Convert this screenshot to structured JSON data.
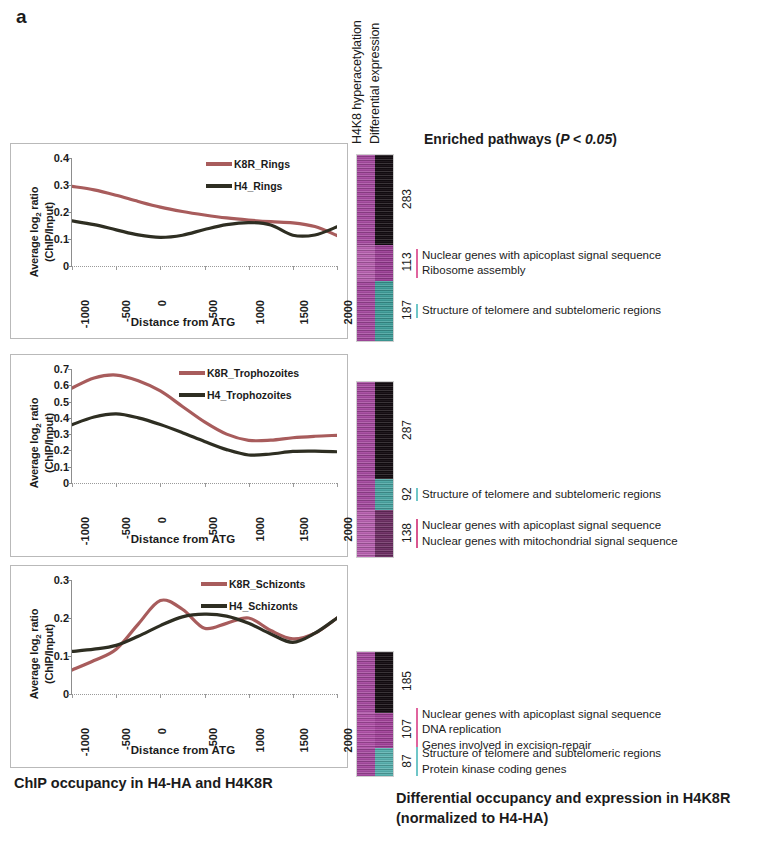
{
  "figure": {
    "panel_label": "a",
    "caption_left": "ChIP occupancy in H4-HA and H4K8R",
    "caption_right_line1": "Differential occupancy and expression in H4K8R",
    "caption_right_line2": "(normalized to H4-HA)",
    "enriched_title_prefix": "Enriched pathways (",
    "enriched_title_italic": "P < 0.05",
    "enriched_title_suffix": ")"
  },
  "heatmap_headers": [
    {
      "label": "H4K8 hyperacetylation"
    },
    {
      "label": "Differential expression"
    }
  ],
  "colors": {
    "k8r_line": "#a85c5c",
    "h4_line": "#2e2e22",
    "heat_magenta": "#b455ab",
    "heat_magenta_dark": "#9c3f96",
    "heat_black": "#1a1016",
    "heat_teal": "#3f9e9a",
    "bar_pink": "#e0649e",
    "bar_teal": "#6fc6c8",
    "axis": "#8d8d8d",
    "panel_border": "#b9b9b9"
  },
  "charts": [
    {
      "id": "rings",
      "y_ticks": [
        "0.4",
        "0.3",
        "0.2",
        "0.1",
        "0"
      ],
      "legend": [
        {
          "label": "K8R_Rings",
          "color": "#a85c5c"
        },
        {
          "label": "H4_Rings",
          "color": "#2e2e22"
        }
      ]
    },
    {
      "id": "trophozoites",
      "y_ticks": [
        "0.7",
        "0.6",
        "0.5",
        "0.4",
        "0.3",
        "0.2",
        "0.1",
        "0"
      ],
      "legend": [
        {
          "label": "K8R_Trophozoites",
          "color": "#a85c5c"
        },
        {
          "label": "H4_Trophozoites",
          "color": "#2e2e22"
        }
      ]
    },
    {
      "id": "schizonts",
      "y_ticks": [
        "0.3",
        "0.2",
        "0.1",
        "0"
      ],
      "legend": [
        {
          "label": "K8R_Schizonts",
          "color": "#a85c5c"
        },
        {
          "label": "H4_Schizonts",
          "color": "#2e2e22"
        }
      ]
    }
  ],
  "axis_titles": {
    "y_line1": "Average log",
    "y_sub": "2",
    "y_line1b": " ratio",
    "y_line2": "(ChIP/Input)",
    "x": "Distance from ATG"
  },
  "x_ticklabels": [
    "-1000",
    "-500",
    "0",
    "500",
    "1000",
    "1500",
    "2000"
  ],
  "chart_data": [
    {
      "type": "line",
      "id": "rings",
      "title": "",
      "xlabel": "Distance from ATG",
      "ylabel": "Average log2 ratio (ChIP/Input)",
      "xlim": [
        -1000,
        2000
      ],
      "ylim": [
        0,
        0.4
      ],
      "yticks": [
        0,
        0.1,
        0.2,
        0.3,
        0.4
      ],
      "xticks": [
        -1000,
        -500,
        0,
        500,
        1000,
        1500,
        2000
      ],
      "grid": false,
      "legend_position": "top-right",
      "x": [
        -1000,
        -750,
        -500,
        -250,
        0,
        250,
        500,
        750,
        1000,
        1250,
        1500,
        1750,
        2000
      ],
      "series": [
        {
          "name": "K8R_Rings",
          "color": "#a85c5c",
          "values": [
            0.295,
            0.282,
            0.262,
            0.239,
            0.218,
            0.202,
            0.189,
            0.178,
            0.17,
            0.164,
            0.16,
            0.146,
            0.113
          ]
        },
        {
          "name": "H4_Rings",
          "color": "#2e2e22",
          "values": [
            0.167,
            0.153,
            0.134,
            0.115,
            0.106,
            0.114,
            0.135,
            0.153,
            0.161,
            0.152,
            0.114,
            0.115,
            0.145
          ]
        }
      ]
    },
    {
      "type": "line",
      "id": "trophozoites",
      "title": "",
      "xlabel": "Distance from ATG",
      "ylabel": "Average log2 ratio (ChIP/Input)",
      "xlim": [
        -1000,
        2000
      ],
      "ylim": [
        0,
        0.7
      ],
      "yticks": [
        0,
        0.1,
        0.2,
        0.3,
        0.4,
        0.5,
        0.6,
        0.7
      ],
      "xticks": [
        -1000,
        -500,
        0,
        500,
        1000,
        1500,
        2000
      ],
      "grid": false,
      "legend_position": "top-right",
      "x": [
        -1000,
        -750,
        -500,
        -250,
        0,
        250,
        500,
        750,
        1000,
        1250,
        1500,
        1750,
        2000
      ],
      "series": [
        {
          "name": "K8R_Trophozoites",
          "color": "#a85c5c",
          "values": [
            0.583,
            0.645,
            0.663,
            0.628,
            0.565,
            0.47,
            0.375,
            0.3,
            0.262,
            0.263,
            0.278,
            0.287,
            0.293
          ]
        },
        {
          "name": "H4_Trophozoites",
          "color": "#2e2e22",
          "values": [
            0.358,
            0.405,
            0.424,
            0.4,
            0.359,
            0.309,
            0.255,
            0.205,
            0.172,
            0.178,
            0.194,
            0.196,
            0.192
          ]
        }
      ]
    },
    {
      "type": "line",
      "id": "schizonts",
      "title": "",
      "xlabel": "Distance from ATG",
      "ylabel": "Average log2 ratio (ChIP/Input)",
      "xlim": [
        -1000,
        2000
      ],
      "ylim": [
        0,
        0.3
      ],
      "yticks": [
        0,
        0.1,
        0.2,
        0.3
      ],
      "xticks": [
        -1000,
        -500,
        0,
        500,
        1000,
        1500,
        2000
      ],
      "grid": false,
      "legend_position": "top-right",
      "x": [
        -1000,
        -750,
        -500,
        -250,
        0,
        250,
        500,
        750,
        1000,
        1250,
        1500,
        1750,
        2000
      ],
      "series": [
        {
          "name": "K8R_Schizonts",
          "color": "#a85c5c",
          "values": [
            0.063,
            0.088,
            0.118,
            0.184,
            0.246,
            0.223,
            0.173,
            0.186,
            0.2,
            0.167,
            0.145,
            0.16,
            0.2
          ]
        },
        {
          "name": "H4_Schizonts",
          "color": "#2e2e22",
          "values": [
            0.112,
            0.118,
            0.128,
            0.152,
            0.18,
            0.203,
            0.21,
            0.205,
            0.186,
            0.158,
            0.136,
            0.16,
            0.2
          ]
        }
      ]
    }
  ],
  "heatmaps": [
    {
      "id": "rings",
      "groups": [
        {
          "count": "283",
          "bar_color": "none",
          "hyperacet": "#a64aa0",
          "diffexpr": "#140d12",
          "pathways": []
        },
        {
          "count": "113",
          "bar_color": "#e0649e",
          "hyperacet": "#b861b0",
          "diffexpr": "#9c3f96",
          "pathways": [
            "Nuclear genes with apicoplast signal sequence",
            "Ribosome assembly"
          ]
        },
        {
          "count": "187",
          "bar_color": "#6fc6c8",
          "hyperacet": "#a64aa0",
          "diffexpr": "#3f9e9a",
          "pathways": [
            "Structure of telomere and subtelomeric regions"
          ]
        }
      ]
    },
    {
      "id": "trophozoites",
      "groups": [
        {
          "count": "287",
          "bar_color": "none",
          "hyperacet": "#a64aa0",
          "diffexpr": "#140d12",
          "pathways": []
        },
        {
          "count": "92",
          "bar_color": "#6fc6c8",
          "hyperacet": "#a64aa0",
          "diffexpr": "#4aa5a2",
          "pathways": [
            "Structure of telomere and subtelomeric regions"
          ]
        },
        {
          "count": "138",
          "bar_color": "#d9558f",
          "hyperacet": "#b861b0",
          "diffexpr": "#6d2e63",
          "pathways": [
            "Nuclear genes with apicoplast signal sequence",
            "Nuclear genes with mitochondrial signal sequence"
          ]
        }
      ]
    },
    {
      "id": "schizonts",
      "groups": [
        {
          "count": "185",
          "bar_color": "none",
          "hyperacet": "#a64aa0",
          "diffexpr": "#140d12",
          "pathways": []
        },
        {
          "count": "107",
          "bar_color": "#e0649e",
          "hyperacet": "#b050a8",
          "diffexpr": "#a2429a",
          "pathways": [
            "Nuclear genes with apicoplast signal sequence",
            "DNA replication",
            "Genes involved in excision-repair"
          ]
        },
        {
          "count": "87",
          "bar_color": "#6fc6c8",
          "hyperacet": "#a64aa0",
          "diffexpr": "#57b0ae",
          "pathways": [
            "Structure of telomere and subtelomeric regions",
            "Protein kinase coding genes"
          ]
        }
      ]
    }
  ]
}
